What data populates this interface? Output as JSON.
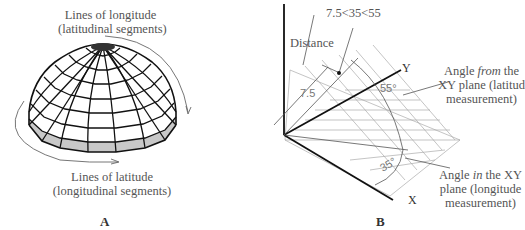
{
  "panel_a": {
    "letter": "A",
    "label_top_line1": "Lines of longitude",
    "label_top_line2": "(latitudinal segments)",
    "label_bottom_line1": "Lines of latitude",
    "label_bottom_line2": "(longitudinal segments)"
  },
  "panel_b": {
    "letter": "B",
    "coordinate_input": "7.5<35<55",
    "distance_label": "Distance",
    "distance_value": "7.5",
    "latitude_angle": "55°",
    "longitude_angle": "35°",
    "axis_y": "Y",
    "axis_x": "X",
    "from_label_pre": "Angle ",
    "from_label_em": "from",
    "from_label_post": " the",
    "from_line2": "XY plane (latitude",
    "from_line3": "measurement)",
    "in_label_pre": "Angle ",
    "in_label_em": "in",
    "in_label_post": " the XY",
    "in_line2": "plane (longitude",
    "in_line3": "measurement)"
  },
  "colors": {
    "line": "#111111",
    "gray_fill": "#c8c8c8",
    "grid": "#aaaaaa",
    "text": "#555555"
  }
}
